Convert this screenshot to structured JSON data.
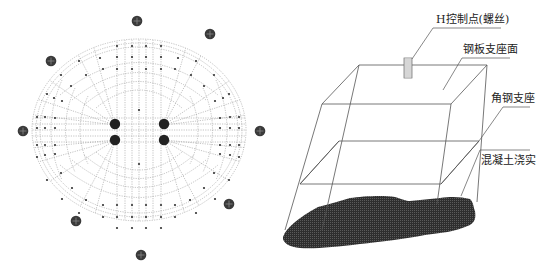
{
  "figure": {
    "left_panel": {
      "title": "",
      "description": "Plan view of circular grid of control points with surrounding markers",
      "outer_markers_count": 10,
      "center_bolts_count": 4,
      "colors": {
        "grid": "#9a9a9a",
        "dots": "#333333",
        "markers": "#3a3a3a"
      }
    },
    "right_panel": {
      "labels": {
        "h_control_point": "H控制点(螺丝)",
        "steel_plate_surface": "钢板支座面",
        "angle_steel_support": "角钢支座",
        "concrete_compacted": "混凝土浇实"
      },
      "colors": {
        "lines": "#555555",
        "concrete": "#2e2e2e",
        "text": "#222222"
      }
    }
  }
}
